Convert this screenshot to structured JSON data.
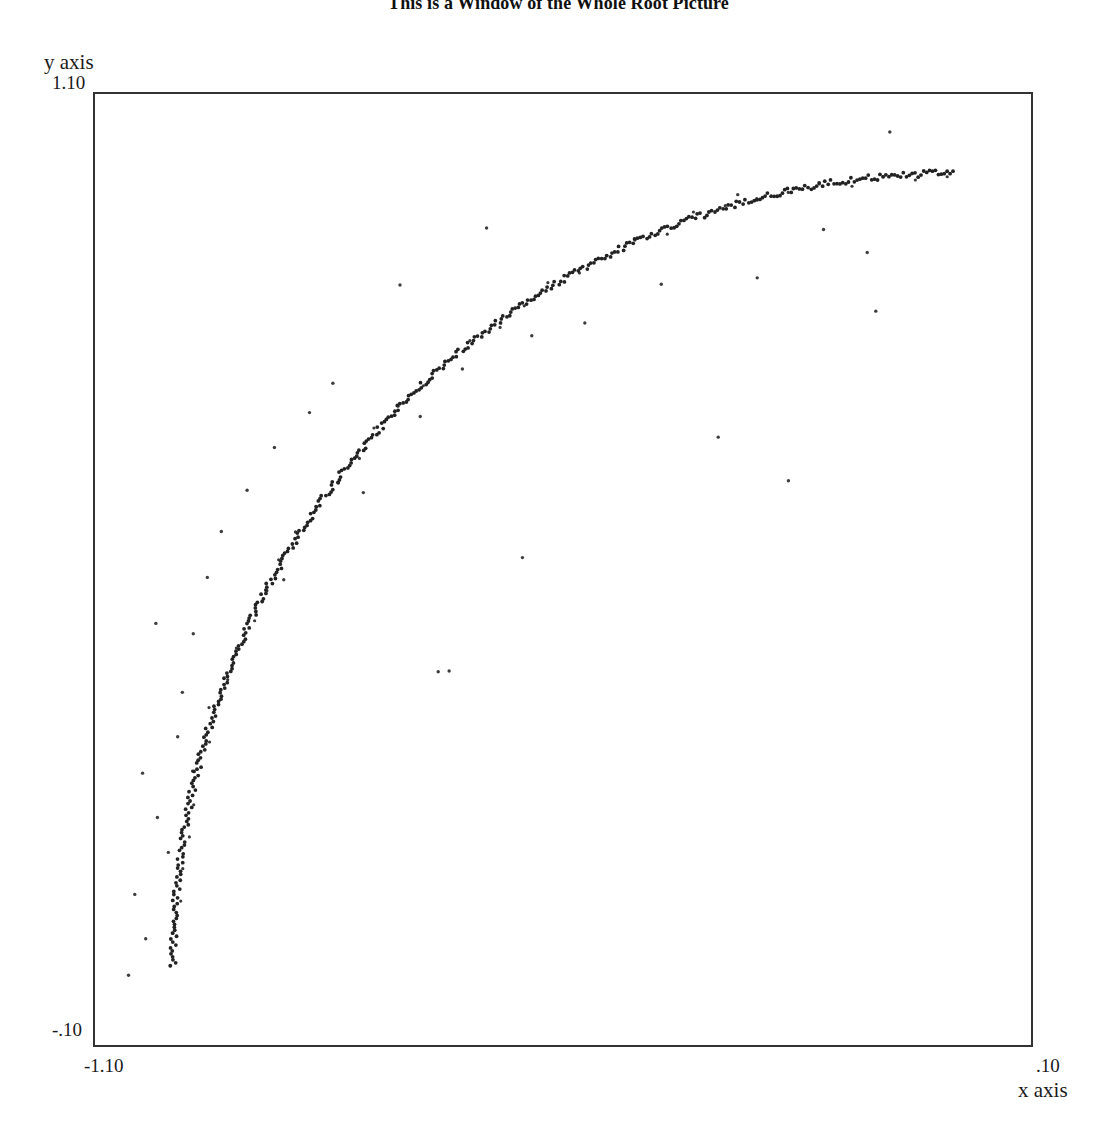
{
  "chart": {
    "title": "This is a Window of the Whole Root Picture",
    "y_axis_label": "y axis",
    "x_axis_label": "x axis",
    "y_max_tick": "1.10",
    "y_min_tick": "-.10",
    "x_min_tick": "-1.10",
    "x_max_tick": ".10",
    "frame_color": "#333333",
    "curve_color": "#1a1a1a",
    "point_color": "#222222",
    "background_color": "#ffffff"
  },
  "chart_data": {
    "type": "scatter",
    "title": "This is a Window of the Whole Root Picture",
    "xlabel": "x axis",
    "ylabel": "y axis",
    "xlim": [
      -1.1,
      0.1
    ],
    "ylim": [
      -0.1,
      1.1
    ],
    "xticks": [
      -1.1,
      0.1
    ],
    "xticklabels": [
      "-1.10",
      ".10"
    ],
    "yticks": [
      -0.1,
      1.1
    ],
    "yticklabels": [
      "-.10",
      "1.10"
    ],
    "grid": false,
    "legend": null,
    "series": [
      {
        "name": "roots-on-unit-arc",
        "marker": "dot",
        "comment": "Points sampled densely along x^2 + y^2 = 1 for x in [-1, 0], y >= 0, with small radial jitter making the arc appear as a thick line.",
        "curve": {
          "equation": "x^2 + y^2 = 1",
          "radius": 1.0,
          "center": [
            0,
            0
          ],
          "x_range": [
            -1.0,
            0.0
          ],
          "y_range": [
            0.0,
            1.0
          ]
        },
        "n_points": 420,
        "jitter_radial": 0.004
      },
      {
        "name": "outlier-noise",
        "marker": "dot",
        "comment": "Sparse isolated points scattered off the arc.",
        "points": [
          [
            -0.081,
            1.052
          ],
          [
            -0.276,
            0.973
          ],
          [
            -0.598,
            0.931
          ],
          [
            -0.166,
            0.929
          ],
          [
            -0.11,
            0.9
          ],
          [
            -0.099,
            0.826
          ],
          [
            -0.251,
            0.868
          ],
          [
            -0.374,
            0.86
          ],
          [
            -0.472,
            0.811
          ],
          [
            -0.709,
            0.859
          ],
          [
            -0.54,
            0.795
          ],
          [
            -0.629,
            0.753
          ],
          [
            -0.795,
            0.735
          ],
          [
            -0.825,
            0.698
          ],
          [
            -0.683,
            0.693
          ],
          [
            -0.87,
            0.654
          ],
          [
            -0.905,
            0.6
          ],
          [
            -0.756,
            0.597
          ],
          [
            -0.938,
            0.548
          ],
          [
            -0.956,
            0.49
          ],
          [
            -0.858,
            0.487
          ],
          [
            -0.974,
            0.419
          ],
          [
            -1.022,
            0.432
          ],
          [
            -0.988,
            0.345
          ],
          [
            -0.994,
            0.289
          ],
          [
            -1.039,
            0.243
          ],
          [
            -1.02,
            0.187
          ],
          [
            -1.006,
            0.143
          ],
          [
            -1.049,
            0.09
          ],
          [
            -1.035,
            0.034
          ],
          [
            -1.057,
            -0.012
          ],
          [
            -0.646,
            0.372
          ],
          [
            -0.66,
            0.371
          ],
          [
            -0.301,
            0.667
          ],
          [
            -0.211,
            0.612
          ],
          [
            -0.552,
            0.515
          ]
        ]
      }
    ]
  }
}
